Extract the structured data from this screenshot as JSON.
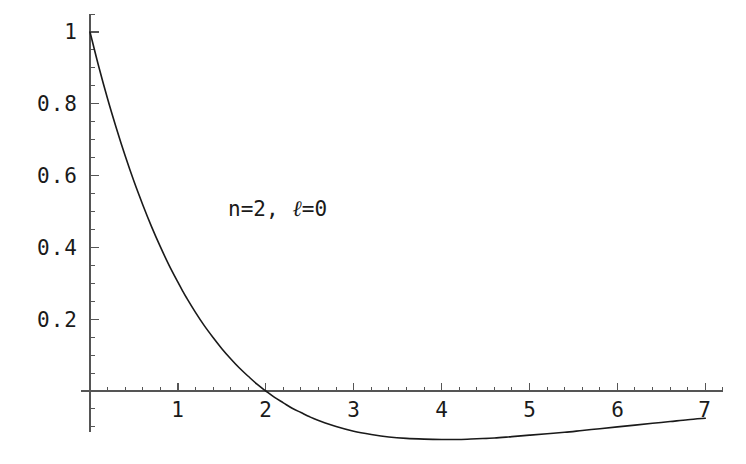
{
  "figure": {
    "background_color": "#ffffff",
    "curve_color": "#1a1a1a",
    "axis_color": "#555555",
    "text_color": "#1a1a1a"
  },
  "annotation": {
    "prefix": "n=2,",
    "ell_symbol": "ℓ",
    "suffix": "=0",
    "full_text": "n=2,  ℓ=0"
  },
  "chart_data": {
    "type": "line",
    "title": "",
    "subtitle": "",
    "xlabel": "",
    "ylabel": "",
    "xlim": [
      -0.1,
      7.2
    ],
    "ylim": [
      -0.2,
      1.05
    ],
    "grid": false,
    "legend": null,
    "legend_position": "none",
    "annotations": [
      {
        "text": "n=2,  ℓ=0",
        "x": 2.1,
        "y": 0.5
      }
    ],
    "x_ticks_major": [
      0,
      1,
      2,
      3,
      4,
      5,
      6,
      7
    ],
    "x_tick_labels": [
      "",
      "1",
      "2",
      "3",
      "4",
      "5",
      "6",
      "7"
    ],
    "x_ticks_minor_step": 0.2,
    "y_ticks_major": [
      0.2,
      0.4,
      0.6,
      0.8,
      1
    ],
    "y_tick_labels": [
      "0.2",
      "0.4",
      "0.6",
      "0.8",
      "1"
    ],
    "y_ticks_minor_step": 0.05,
    "series": [
      {
        "name": "R20",
        "description": "hydrogen 2s radial wavefunction, normalized to 1 at r=0",
        "x": [
          0,
          0.1,
          0.2,
          0.3,
          0.4,
          0.5,
          0.6,
          0.7,
          0.8,
          0.9,
          1.0,
          1.06,
          1.1,
          1.2,
          1.3,
          1.4,
          1.5,
          1.6,
          1.7,
          1.8,
          1.9,
          2.0,
          2.1,
          2.2,
          2.3,
          2.4,
          2.5,
          2.6,
          2.8,
          3.0,
          3.2,
          3.4,
          3.6,
          3.8,
          4.0,
          4.2,
          4.4,
          4.6,
          4.8,
          5.0,
          5.2,
          5.4,
          5.6,
          5.8,
          6.0,
          6.2,
          6.4,
          6.6,
          6.8,
          7.0
        ],
        "y": [
          1.0,
          0.903,
          0.814,
          0.732,
          0.655,
          0.584,
          0.519,
          0.458,
          0.402,
          0.35,
          0.303,
          0.276,
          0.259,
          0.219,
          0.182,
          0.149,
          0.118,
          0.09,
          0.064,
          0.041,
          0.019,
          0.0,
          -0.018,
          -0.033,
          -0.048,
          -0.06,
          -0.072,
          -0.082,
          -0.099,
          -0.112,
          -0.121,
          -0.128,
          -0.132,
          -0.134,
          -0.135,
          -0.135,
          -0.133,
          -0.131,
          -0.127,
          -0.123,
          -0.119,
          -0.115,
          -0.11,
          -0.105,
          -0.1,
          -0.095,
          -0.09,
          -0.085,
          -0.08,
          -0.076
        ],
        "zero_crossing_x": 2.0,
        "minimum_x": 4.0,
        "minimum_y": -0.135
      }
    ]
  },
  "axes_pixels": {
    "x_origin_px": 90,
    "y_origin_px": 391,
    "px_per_x_unit": 87.9,
    "px_per_y_unit": 359
  }
}
